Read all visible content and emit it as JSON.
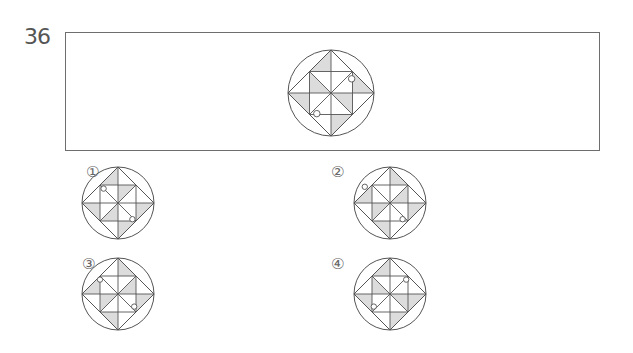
{
  "question": {
    "number": "36",
    "figure": {
      "cx": 331,
      "cy": 93,
      "r": 43,
      "shaded": [
        [
          [
            0,
            -1
          ],
          [
            0,
            -0.5
          ],
          [
            -0.5,
            -0.5
          ]
        ],
        [
          [
            -0.5,
            -0.5
          ],
          [
            0,
            0
          ],
          [
            -0.5,
            0
          ]
        ],
        [
          [
            1,
            0
          ],
          [
            0.5,
            0
          ],
          [
            0.5,
            -0.5
          ]
        ],
        [
          [
            0.5,
            0.5
          ],
          [
            0,
            0
          ],
          [
            0.5,
            0
          ]
        ],
        [
          [
            0,
            1
          ],
          [
            0,
            0.5
          ],
          [
            0.5,
            0.5
          ]
        ],
        [
          [
            -1,
            0
          ],
          [
            -0.5,
            0
          ],
          [
            -0.5,
            0.5
          ]
        ]
      ],
      "dots": [
        [
          0.48,
          -0.33
        ],
        [
          -0.33,
          0.48
        ]
      ]
    }
  },
  "options": [
    {
      "label": "①",
      "label_x": 86,
      "label_y": 163,
      "cx": 118,
      "cy": 203,
      "r": 36,
      "shaded": [
        [
          [
            0,
            -1
          ],
          [
            0,
            -0.5
          ],
          [
            -0.5,
            -0.5
          ]
        ],
        [
          [
            0,
            -0.5
          ],
          [
            0,
            0
          ],
          [
            0.5,
            -0.5
          ]
        ],
        [
          [
            1,
            0
          ],
          [
            0.5,
            0
          ],
          [
            0.5,
            0.5
          ]
        ],
        [
          [
            -1,
            0
          ],
          [
            -0.5,
            0
          ],
          [
            -0.5,
            0.5
          ]
        ],
        [
          [
            0,
            0.5
          ],
          [
            0,
            0
          ],
          [
            -0.5,
            0.5
          ]
        ],
        [
          [
            0,
            1
          ],
          [
            0,
            0.5
          ],
          [
            0.5,
            0.5
          ]
        ]
      ],
      "dots": [
        [
          -0.4,
          -0.4
        ],
        [
          0.4,
          0.45
        ]
      ]
    },
    {
      "label": "②",
      "label_x": 331,
      "label_y": 163,
      "cx": 390,
      "cy": 203,
      "r": 36,
      "shaded": [
        [
          [
            0,
            -1
          ],
          [
            0,
            -0.5
          ],
          [
            0.5,
            -0.5
          ]
        ],
        [
          [
            -1,
            0
          ],
          [
            -0.5,
            0
          ],
          [
            -0.5,
            -0.5
          ]
        ],
        [
          [
            -0.5,
            0
          ],
          [
            0,
            0
          ],
          [
            -0.5,
            0.5
          ]
        ],
        [
          [
            0.5,
            0
          ],
          [
            0,
            0
          ],
          [
            0.5,
            -0.5
          ]
        ],
        [
          [
            1,
            0
          ],
          [
            0.5,
            0
          ],
          [
            0.5,
            0.5
          ]
        ],
        [
          [
            0,
            1
          ],
          [
            0,
            0.5
          ],
          [
            -0.5,
            0.5
          ]
        ]
      ],
      "dots": [
        [
          -0.7,
          -0.45
        ],
        [
          0.35,
          0.45
        ]
      ]
    },
    {
      "label": "③",
      "label_x": 82,
      "label_y": 255,
      "cx": 118,
      "cy": 294,
      "r": 36,
      "shaded": [
        [
          [
            0,
            -1
          ],
          [
            0,
            -0.5
          ],
          [
            0.5,
            -0.5
          ]
        ],
        [
          [
            -1,
            0
          ],
          [
            -0.5,
            0
          ],
          [
            -0.5,
            -0.5
          ]
        ],
        [
          [
            -0.5,
            0
          ],
          [
            0,
            0
          ],
          [
            -0.5,
            0.5
          ]
        ],
        [
          [
            0.5,
            0
          ],
          [
            0,
            0
          ],
          [
            0.5,
            -0.5
          ]
        ],
        [
          [
            1,
            0
          ],
          [
            0.5,
            0
          ],
          [
            0.5,
            0.5
          ]
        ],
        [
          [
            0,
            1
          ],
          [
            0,
            0.5
          ],
          [
            -0.5,
            0.5
          ]
        ]
      ],
      "dots": [
        [
          -0.5,
          -0.4
        ],
        [
          0.45,
          0.35
        ]
      ]
    },
    {
      "label": "④",
      "label_x": 331,
      "label_y": 255,
      "cx": 390,
      "cy": 294,
      "r": 36,
      "shaded": [
        [
          [
            0,
            -1
          ],
          [
            0,
            -0.5
          ],
          [
            -0.5,
            -0.5
          ]
        ],
        [
          [
            1,
            0
          ],
          [
            0.5,
            0
          ],
          [
            0.5,
            0.5
          ]
        ],
        [
          [
            -1,
            0
          ],
          [
            -0.5,
            0
          ],
          [
            -0.5,
            0.5
          ]
        ],
        [
          [
            0,
            1
          ],
          [
            0,
            0.5
          ],
          [
            0.5,
            0.5
          ]
        ],
        [
          [
            -0.5,
            -0.5
          ],
          [
            0,
            0
          ],
          [
            -0.5,
            0
          ]
        ],
        [
          [
            0.5,
            0.5
          ],
          [
            0,
            0
          ],
          [
            0.5,
            0
          ]
        ]
      ],
      "dots": [
        [
          0.45,
          -0.4
        ],
        [
          -0.45,
          0.35
        ]
      ]
    }
  ],
  "colors": {
    "shade": "#dcdcdc",
    "stroke": "#555555"
  }
}
